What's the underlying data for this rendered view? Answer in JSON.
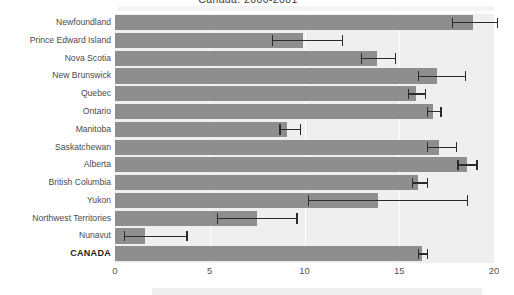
{
  "chart_data": {
    "type": "bar",
    "orientation": "horizontal",
    "title": "Canada, 2000-2001",
    "xlabel": "",
    "ylabel": "",
    "xlim": [
      0,
      20
    ],
    "xticks": [
      0,
      5,
      10,
      15,
      20
    ],
    "xtick_labels": [
      "0",
      "5",
      "10",
      "15",
      "20"
    ],
    "grid": true,
    "grid_axis": "x",
    "legend": false,
    "error_bars": "95% confidence interval",
    "bar_color": "#8e8e8e",
    "error_color": "#2b2b2b",
    "plot_background": "#efefef",
    "categories": [
      "Newfoundland",
      "Prince Edward Island",
      "Nova Scotia",
      "New Brunswick",
      "Quebec",
      "Ontario",
      "Manitoba",
      "Saskatchewan",
      "Alberta",
      "British Columbia",
      "Yukon",
      "Northwest Territories",
      "Nunavut",
      "CANADA"
    ],
    "emphasized_categories": [
      "CANADA"
    ],
    "values": [
      18.9,
      9.9,
      13.8,
      17.0,
      15.9,
      16.8,
      9.1,
      17.1,
      18.6,
      16.0,
      13.9,
      7.5,
      1.6,
      16.2
    ],
    "ci_low": [
      17.8,
      8.3,
      13.0,
      16.0,
      15.5,
      16.5,
      8.7,
      16.5,
      18.1,
      15.7,
      10.2,
      5.4,
      0.5,
      16.0
    ],
    "ci_high": [
      20.2,
      12.0,
      14.8,
      18.5,
      16.4,
      17.2,
      9.8,
      18.0,
      19.1,
      16.5,
      18.6,
      9.6,
      3.8,
      16.5
    ]
  }
}
